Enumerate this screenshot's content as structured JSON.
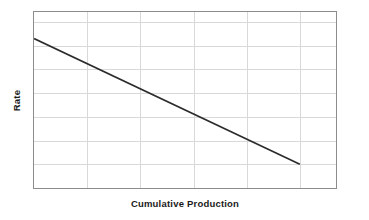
{
  "figure": {
    "width": 369,
    "height": 220,
    "background": "#ffffff",
    "title": ""
  },
  "axes": {
    "x_label": "Cumulative Production",
    "y_label": "Rate",
    "border_color": "#8c8c8c",
    "grid_color": "#d9d9d9",
    "line_color": "#2b2b2b",
    "x_tick_labels": [],
    "y_tick_labels": []
  },
  "chart_data": {
    "type": "line",
    "title": "",
    "subtitle": "",
    "xlabel": "Cumulative Production",
    "ylabel": "Rate",
    "xlim": [
      0,
      5.68
    ],
    "ylim": [
      0,
      7.42
    ],
    "x": [
      0.0,
      5.0
    ],
    "y": [
      6.3,
      1.0
    ],
    "series": [
      {
        "name": "Rate decline",
        "x": [
          0.0,
          5.0
        ],
        "y": [
          6.3,
          1.0
        ],
        "color": "#2b2b2b",
        "style": "solid",
        "width": 1.6
      }
    ],
    "grid": true,
    "grid_x_positions": [
      1,
      2,
      3,
      4,
      5
    ],
    "grid_y_positions": [
      1,
      2,
      3,
      4,
      5,
      6,
      7
    ],
    "legend": null,
    "legend_position": "none",
    "annotations": [],
    "axis_ticks_labeled": false
  }
}
